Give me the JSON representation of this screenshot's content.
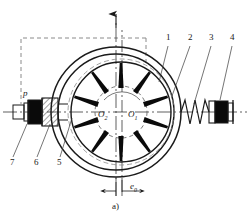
{
  "figure": {
    "caption": "a)",
    "type": "variable-displacement-vane-pump-schematic",
    "center_labels": [
      {
        "id": "O1",
        "base": "O",
        "sub": "1",
        "x": 131,
        "y": 116
      },
      {
        "id": "O2",
        "base": "O",
        "sub": "2",
        "x": 101,
        "y": 116
      }
    ],
    "pressure_label": {
      "text": "p",
      "x": 24,
      "y": 95
    },
    "eccentricity_label": {
      "base": "e",
      "sub": "0",
      "x": 133,
      "y": 188
    },
    "callouts": [
      {
        "num": "1",
        "x": 168,
        "y": 39
      },
      {
        "num": "2",
        "x": 190,
        "y": 39
      },
      {
        "num": "3",
        "x": 211,
        "y": 39
      },
      {
        "num": "4",
        "x": 232,
        "y": 39
      },
      {
        "num": "5",
        "x": 59,
        "y": 163
      },
      {
        "num": "6",
        "x": 35,
        "y": 163
      },
      {
        "num": "7",
        "x": 11,
        "y": 163
      }
    ],
    "geometry": {
      "stator_outer_r": 65,
      "stator_mid_r": 58,
      "rotor_outer_r": 50,
      "rotor_hub_r": 26,
      "stator_center": [
        116,
        112
      ],
      "rotor_center": [
        121,
        112
      ],
      "vane_count": 10
    },
    "colors": {
      "line": "#1a1a1a",
      "vane_fill": "#0a0a0a",
      "dashed": "#8a8a8a",
      "hatch": "#2a2a2a"
    }
  }
}
